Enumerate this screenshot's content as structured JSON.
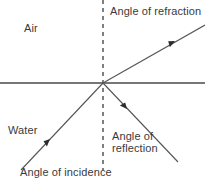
{
  "diagram": {
    "labels": {
      "air": "Air",
      "water": "Water",
      "angle_of_refraction": "Angle of refraction",
      "angle_of_reflection": "Angle of\nreflection",
      "angle_of_incidence": "Angle of incidence"
    },
    "colors": {
      "stroke": "#555555",
      "boundary": "#4a4a4a",
      "text": "#3a3a3a",
      "background": "#ffffff"
    },
    "geometry": {
      "incidence_point": [
        103,
        83
      ],
      "boundary_line": {
        "x1": 0,
        "y1": 83,
        "x2": 205,
        "y2": 83
      },
      "normal_dashed_line": {
        "x1": 103,
        "y1": 0,
        "x2": 103,
        "y2": 170
      },
      "incident_ray": {
        "x1": 21,
        "y1": 170,
        "x2": 103,
        "y2": 83,
        "arrow_at": [
          48,
          141
        ]
      },
      "refracted_ray": {
        "x1": 103,
        "y1": 83,
        "x2": 205,
        "y2": 25,
        "arrow_at": [
          173,
          42
        ]
      },
      "reflected_ray": {
        "x1": 103,
        "y1": 83,
        "x2": 178,
        "y2": 162,
        "arrow_at": [
          125,
          107
        ]
      }
    }
  }
}
